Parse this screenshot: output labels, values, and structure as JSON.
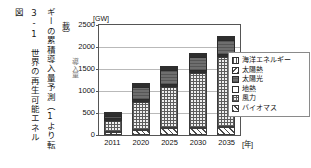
{
  "caption": {
    "line_1": "載）",
    "line_2": "ギーの累積導入量予測（1より転",
    "line_3": "3-1　世界の再生可能エネル",
    "line_4": "図"
  },
  "chart_data": {
    "type": "bar",
    "stacked": true,
    "title": "",
    "unit_label": "[GW]",
    "xlabel": "[年]",
    "ylabel": "導入量",
    "categories": [
      "2011",
      "2020",
      "2025",
      "2030",
      "2035"
    ],
    "ylim": [
      0,
      2500
    ],
    "yticks": [
      0,
      500,
      1000,
      1500,
      2000,
      2500
    ],
    "ytick_labels": [
      "0",
      "500",
      "1000",
      "1500",
      "2000",
      "2500"
    ],
    "grid": true,
    "legend_position": "right",
    "series": [
      {
        "name": "バイオマス",
        "key": "biomass",
        "values": [
          75,
          120,
          150,
          165,
          180
        ]
      },
      {
        "name": "風力",
        "key": "wind",
        "values": [
          240,
          620,
          940,
          1240,
          1600
        ]
      },
      {
        "name": "地熱",
        "key": "geothermal",
        "values": [
          12,
          20,
          25,
          30,
          35
        ]
      },
      {
        "name": "太陽光",
        "key": "pv",
        "values": [
          70,
          300,
          340,
          320,
          340
        ]
      },
      {
        "name": "太陽熱",
        "key": "solar_thermal",
        "values": [
          8,
          20,
          30,
          35,
          40
        ]
      },
      {
        "name": "海洋エネルギー",
        "key": "ocean",
        "values": [
          3,
          10,
          15,
          20,
          25
        ]
      }
    ],
    "totals": [
      408,
      1090,
      1500,
      1810,
      2220
    ],
    "legend": [
      {
        "label": "海洋エネルギー",
        "swatch": "pat-ocean"
      },
      {
        "label": "太陽熱",
        "swatch": "pat-thermal"
      },
      {
        "label": "太陽光",
        "swatch": "pat-pv"
      },
      {
        "label": "地熱",
        "swatch": "pat-geo"
      },
      {
        "label": "風力",
        "swatch": "pat-wind"
      },
      {
        "label": "バイオマス",
        "swatch": "pat-biomass"
      }
    ],
    "colors": {
      "grid": "#b9b9b9",
      "axis": "#555555",
      "pv_fill": "#6e6e6e",
      "wind_fill": "#efefef",
      "text": "#111111"
    }
  }
}
